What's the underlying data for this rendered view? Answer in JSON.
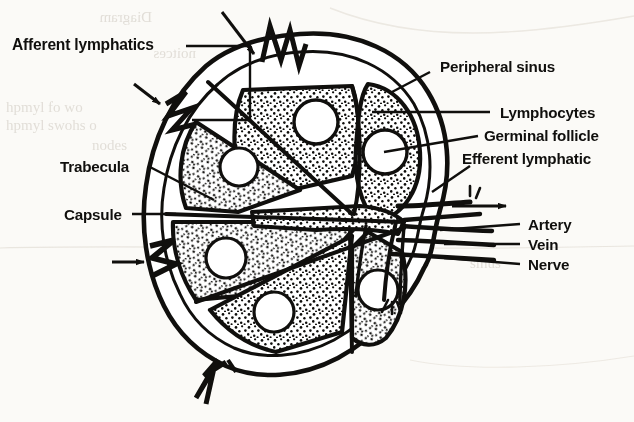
{
  "figure": {
    "background_color": "#fbfaf7",
    "ink_color": "#100f0d",
    "ghost_color": "#ddd9d2"
  },
  "labels": {
    "afferent_lymphatics": "Afferent lymphatics",
    "trabecula": "Trabecula",
    "capsule": "Capsule",
    "peripheral_sinus": "Peripheral sinus",
    "lymphocytes": "Lymphocytes",
    "germinal_follicle": "Germinal follicle",
    "efferent_lymphatic": "Efferent lymphatic",
    "artery": "Artery",
    "vein": "Vein",
    "nerve": "Nerve"
  },
  "structures": {
    "capsule_outline": "oval node capsule",
    "lobule_count": 6,
    "follicle_count": 6,
    "afferent_vessel_count": 3,
    "efferent_vessel_count": 1,
    "hilar_vessels": [
      "Artery",
      "Vein",
      "Nerve"
    ]
  },
  "ghost_text": {
    "g1": "Diagram",
    "g2": "noitces",
    "g3": "hpmyl fo wo",
    "g4": "hpmyl swohs o",
    "g5": "nodes",
    "g6": "Figure 2",
    "g7": "nodes",
    "g8": "sinus"
  }
}
